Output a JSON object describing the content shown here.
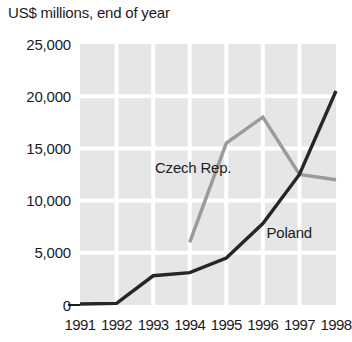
{
  "chart_data": {
    "type": "line",
    "title": "US$ millions, end of year",
    "xlabel": "",
    "ylabel": "",
    "x": [
      1991,
      1992,
      1993,
      1994,
      1995,
      1996,
      1997,
      1998
    ],
    "xtick_labels": [
      "1991",
      "1992",
      "1993",
      "1994",
      "1995",
      "1996",
      "1997",
      "1998"
    ],
    "ytick_labels": [
      "0",
      "5,000",
      "10,000",
      "15,000",
      "20,000",
      "25,000"
    ],
    "ytick_values": [
      0,
      5000,
      10000,
      15000,
      20000,
      25000
    ],
    "ylim": [
      0,
      25000
    ],
    "grid": true,
    "legend_position": "inline-labels",
    "plot_background": "#e6e6e6",
    "gridline_color": "#ffffff",
    "series": [
      {
        "name": "Czech Rep.",
        "color": "#9a9a9a",
        "label_x": 1993.05,
        "label_y": 12600,
        "values": [
          null,
          null,
          null,
          6000,
          15500,
          18000,
          12500,
          12000
        ]
      },
      {
        "name": "Poland",
        "color": "#262626",
        "label_x": 1996.1,
        "label_y": 6400,
        "values": [
          100,
          150,
          2800,
          3100,
          4500,
          7800,
          12500,
          20500
        ]
      }
    ]
  }
}
